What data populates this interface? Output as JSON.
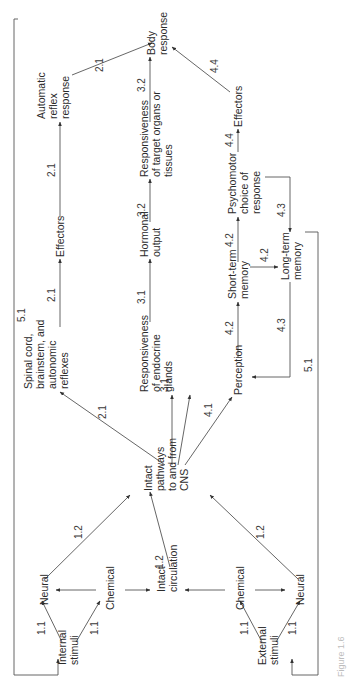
{
  "diagram": {
    "orientation": "rotated-90-ccw",
    "nodes": {
      "internal_stimuli": [
        "Internal",
        "stimuli"
      ],
      "neural_top": [
        "Neural"
      ],
      "chemical_top": [
        "Chemical"
      ],
      "intact_circulation": [
        "Intact",
        "circulation"
      ],
      "external_stimuli": [
        "External",
        "stimuli"
      ],
      "chemical_bottom": [
        "Chemical"
      ],
      "neural_bottom": [
        "Neural"
      ],
      "intact_pathways": [
        "Intact",
        "pathways",
        "to and from",
        "CNS"
      ],
      "spinal_cord": [
        "Spinal cord,",
        "brainstem, and",
        "autonomic",
        "reflexes"
      ],
      "effectors_top": [
        "Effectors"
      ],
      "automatic_reflex": [
        "Automatic",
        "reflex",
        "response"
      ],
      "body_response": [
        "Body",
        "response"
      ],
      "endocrine_glands": [
        "Responsiveness",
        "of endocrine",
        "glands"
      ],
      "hormonal_output": [
        "Hormonal",
        "output"
      ],
      "target_organs": [
        "Responsiveness",
        "of target organs or",
        "tissues"
      ],
      "perception": [
        "Perception"
      ],
      "short_term_memory": [
        "Short-term",
        "memory"
      ],
      "long_term_memory": [
        "Long-term",
        "memory"
      ],
      "psychomotor_choice": [
        "Psychomotor",
        "choice of",
        "response"
      ],
      "effectors_bottom": [
        "Effectors"
      ]
    },
    "edge_labels": {
      "internal_to_neural": "1.1",
      "internal_to_chemical": "1.1",
      "neural_top_to_pathways": "1.2",
      "chemical_circulation": "1.2",
      "external_to_chemical": "1.1",
      "external_to_neural": "1.1",
      "neural_bottom_to_pathways": "1.2",
      "pathways_to_spinal": "2.1",
      "spinal_to_effectors": "2.1",
      "effectors_to_reflex": "2.1",
      "reflex_to_body": "2.1",
      "pathways_to_endocrine": "3.1",
      "endocrine_to_hormonal": "3.1",
      "hormonal_to_target": "3.2",
      "target_to_body": "3.2",
      "pathways_to_perception": "4.1",
      "perception_to_stm": "4.2",
      "stm_to_ltm": "4.2",
      "stm_to_psychomotor": "4.2",
      "psychomotor_to_ltm": "4.3",
      "ltm_to_perception": "4.3",
      "psychomotor_to_effectors": "4.4",
      "effectors_to_body": "4.4",
      "feedback_top": "5.1",
      "feedback_bottom": "5.1"
    },
    "caption": "Figure 1.6"
  }
}
